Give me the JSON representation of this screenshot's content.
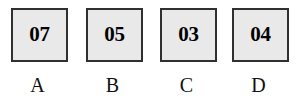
{
  "figure": {
    "name": "labeled-value-boxes",
    "background_color": "#ffffff",
    "box_fill_color": "#e9e9e9",
    "box_border_color": "#303030",
    "text_color": "#000000"
  },
  "items": [
    {
      "value": "07",
      "label": "A"
    },
    {
      "value": "05",
      "label": "B"
    },
    {
      "value": "03",
      "label": "C"
    },
    {
      "value": "04",
      "label": "D"
    }
  ]
}
